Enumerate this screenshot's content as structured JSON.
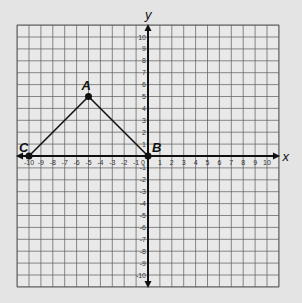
{
  "graph": {
    "x_axis_label": "x",
    "y_axis_label": "y",
    "x_range": [
      -10,
      10
    ],
    "y_range": [
      -10,
      10
    ],
    "grid_range": [
      -11,
      11
    ],
    "x_ticks": [
      "-10",
      "-9",
      "-8",
      "-7",
      "-6",
      "-5",
      "-4",
      "-3",
      "-2",
      "-1",
      "0",
      "1",
      "2",
      "3",
      "4",
      "5",
      "6",
      "7",
      "8",
      "9",
      "10"
    ],
    "y_ticks": [
      "10",
      "9",
      "8",
      "7",
      "6",
      "5",
      "4",
      "3",
      "2",
      "1",
      "-1",
      "-2",
      "-3",
      "-4",
      "-5",
      "-6",
      "-7",
      "-8",
      "-9",
      "-10"
    ],
    "points": [
      {
        "label": "A",
        "x": -5,
        "y": 5
      },
      {
        "label": "B",
        "x": 0,
        "y": 0
      },
      {
        "label": "C",
        "x": -10,
        "y": 0
      }
    ],
    "segments": [
      [
        "C",
        "A"
      ],
      [
        "A",
        "B"
      ]
    ],
    "colors": {
      "background": "#e4e4e4",
      "grid": "#5a5a5a",
      "axis": "#111111",
      "line": "#111111"
    }
  }
}
